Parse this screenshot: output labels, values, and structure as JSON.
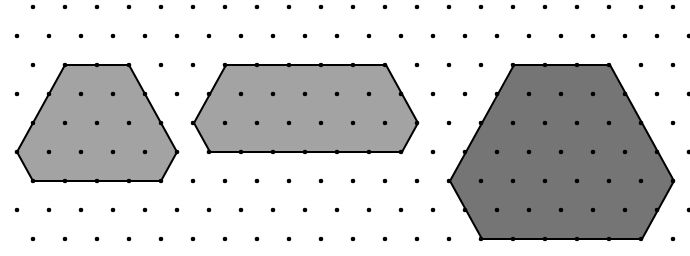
{
  "figure": {
    "width": 690,
    "height": 256,
    "background": "#ffffff"
  },
  "grid": {
    "dot_color": "#000000",
    "dot_radius": 2.3,
    "spacing_x": 32,
    "row_ys": [
      7,
      36,
      65,
      94,
      123,
      152,
      181,
      210,
      239
    ],
    "even_row_start_x": 33,
    "odd_row_start_x": 17,
    "max_x": 690
  },
  "shapes": [
    {
      "name": "small-hexagon",
      "fill": "#a3a3a3",
      "stroke": "#000000",
      "points": [
        [
          65,
          65
        ],
        [
          129,
          65
        ],
        [
          177,
          152
        ],
        [
          161,
          181
        ],
        [
          33,
          181
        ],
        [
          17,
          152
        ]
      ]
    },
    {
      "name": "elongated-hexagon",
      "fill": "#a3a3a3",
      "stroke": "#000000",
      "points": [
        [
          226,
          65
        ],
        [
          386,
          65
        ],
        [
          418,
          123
        ],
        [
          402,
          152
        ],
        [
          210,
          152
        ],
        [
          194,
          123
        ]
      ]
    },
    {
      "name": "large-hexagon",
      "fill": "#757575",
      "stroke": "#000000",
      "points": [
        [
          514,
          65
        ],
        [
          610,
          65
        ],
        [
          674,
          181
        ],
        [
          642,
          239
        ],
        [
          482,
          239
        ],
        [
          450,
          181
        ]
      ]
    }
  ]
}
